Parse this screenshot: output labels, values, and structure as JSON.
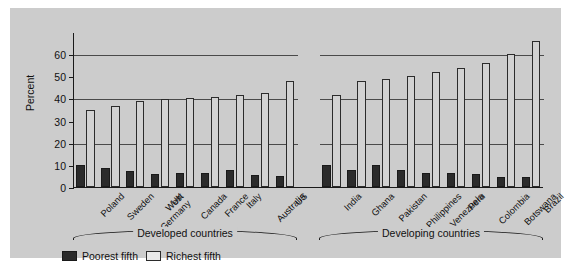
{
  "figure": {
    "background_color": "#cccccc",
    "frame_color": "#1a1a1a"
  },
  "chart_data": {
    "type": "bar",
    "title": "",
    "xlabel": "",
    "ylabel": "Percent",
    "ylim": [
      0,
      70
    ],
    "yticks": [
      0,
      10,
      20,
      30,
      40,
      50,
      60
    ],
    "ytick_labels": [
      "0",
      "10",
      "20",
      "30",
      "40",
      "50",
      "60"
    ],
    "grid": "horizontal gridlines at 20, 40 and 60",
    "legend_position": "below axes, left",
    "series": [
      {
        "name": "Poorest fifth",
        "color": "#2b2b2b",
        "values": [
          10.0,
          8.5,
          7.2,
          6.0,
          6.2,
          6.5,
          7.8,
          5.5,
          5.0,
          9.8,
          7.5,
          9.9,
          7.8,
          6.5,
          6.2,
          5.8,
          4.4,
          4.6
        ]
      },
      {
        "name": "Richest fifth",
        "color": "#ffffff",
        "values": [
          35.0,
          36.8,
          38.9,
          39.8,
          40.0,
          40.8,
          41.4,
          42.6,
          47.7,
          41.4,
          47.8,
          48.8,
          50.2,
          52.0,
          53.7,
          55.8,
          60.0,
          66.0
        ]
      }
    ],
    "categories": [
      "Poland",
      "Sweden",
      "West\nGermany",
      "UK",
      "Canada",
      "France",
      "Italy",
      "Australia",
      "US",
      "India",
      "Ghana",
      "Pakistan",
      "Philippines",
      "Venezuela",
      "Peru",
      "Colombia",
      "Botswana",
      "Brazil"
    ],
    "groups": [
      {
        "label": "Developed countries",
        "start_index": 0,
        "count": 9
      },
      {
        "label": "Developing countries",
        "start_index": 9,
        "count": 9
      }
    ]
  },
  "legend": {
    "items": [
      {
        "label": "Poorest fifth",
        "swatch": "dark-square-icon"
      },
      {
        "label": "Richest fifth",
        "swatch": "light-square-icon"
      }
    ]
  }
}
